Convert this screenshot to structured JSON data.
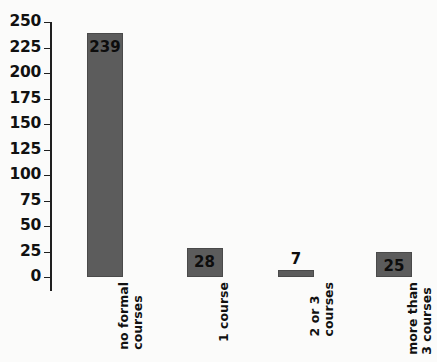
{
  "chart_data": {
    "type": "bar",
    "title": "",
    "subtitle": "",
    "xlabel": "",
    "ylabel": "",
    "categories": [
      "no formal courses",
      "1 course",
      "2 or 3 courses",
      "more than 3 courses"
    ],
    "category_lines": [
      [
        "no formal",
        "courses"
      ],
      [
        "1 course",
        ""
      ],
      [
        "2 or 3",
        "courses"
      ],
      [
        "more than",
        "3 courses"
      ]
    ],
    "values": [
      239,
      28,
      7,
      25
    ],
    "value_labels": [
      "239",
      "28",
      "7",
      "25"
    ],
    "label_placement": [
      "inside",
      "inside",
      "outside",
      "inside"
    ],
    "ylim": [
      0,
      250
    ],
    "ytick_step": 25,
    "yticks": [
      250,
      225,
      200,
      175,
      150,
      125,
      100,
      75,
      50,
      25,
      0
    ],
    "ytick_labels": [
      "250",
      "225",
      "200",
      "175",
      "150",
      "125",
      "100",
      "75",
      "50",
      "25",
      "0"
    ],
    "grid": true,
    "grid_axis": "y",
    "legend": false,
    "legend_position": "none",
    "colors": {
      "bar_fill": "#5c5c5c",
      "bar_border": "#4a4a4a",
      "gridline": "#3a3a3a",
      "axis": "#1f1f1f",
      "text": "#111111",
      "background": "#fbfbfa"
    }
  }
}
